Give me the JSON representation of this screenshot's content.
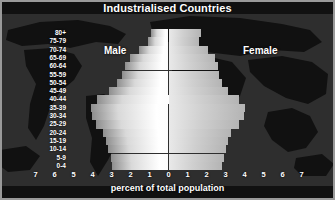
{
  "title": "Industrialised Countries",
  "captions": {
    "male": "Male",
    "female": "Female"
  },
  "axis": {
    "xlabel": "percent of total population",
    "xticks": [
      "7",
      "6",
      "5",
      "4",
      "3",
      "2",
      "1",
      "0",
      "1",
      "2",
      "3",
      "4",
      "5",
      "6",
      "7"
    ]
  },
  "colors": {
    "background": "#2e2e2e",
    "land": "#111111",
    "male_bar": "#ffffff",
    "female_bar": "#c8c8c8",
    "text": "#ffffff",
    "frame": "#9a9a9a"
  },
  "chart_data": {
    "type": "bar",
    "title": "Industrialised Countries",
    "xlabel": "percent of total population",
    "ylabel": "",
    "xlim": [
      -7,
      7
    ],
    "grid": false,
    "legend": "in-plot labels (Male left, Female right)",
    "orientation": "horizontal-diverging-population-pyramid",
    "categories": [
      "0-4",
      "5-9",
      "10-14",
      "15-19",
      "20-24",
      "25-29",
      "30-34",
      "35-39",
      "40-44",
      "45-49",
      "50-54",
      "55-59",
      "60-64",
      "65-69",
      "70-74",
      "75-79",
      "80+"
    ],
    "series": [
      {
        "name": "Male",
        "values": [
          2.95,
          3.05,
          3.2,
          3.3,
          3.45,
          3.8,
          4.05,
          4.1,
          3.75,
          3.15,
          2.7,
          2.45,
          2.3,
          2.05,
          1.55,
          1.1,
          0.9
        ]
      },
      {
        "name": "Female",
        "values": [
          2.8,
          2.9,
          3.05,
          3.15,
          3.3,
          3.7,
          3.95,
          4.0,
          3.7,
          3.15,
          2.8,
          2.65,
          2.6,
          2.45,
          2.1,
          1.6,
          1.7
        ]
      }
    ]
  }
}
